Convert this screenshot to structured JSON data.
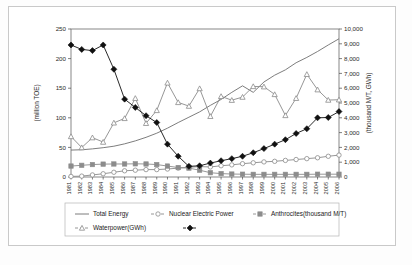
{
  "chart_data": {
    "type": "line",
    "title": "",
    "xlabel": "",
    "ylabel": "(million TOE)",
    "y2label": "(thousand M/T, GWh)",
    "ylim": [
      0,
      250
    ],
    "y2lim": [
      0,
      10000
    ],
    "yticks": [
      "0",
      "50",
      "100",
      "150",
      "200",
      "250"
    ],
    "y2ticks": [
      "0",
      "1,000",
      "2,000",
      "3,000",
      "4,000",
      "5,000",
      "6,000",
      "7,000",
      "8,000",
      "9,000",
      "10,000"
    ],
    "grid": false,
    "legend_position": "bottom",
    "categories": [
      "1981",
      "1982",
      "1983",
      "1984",
      "1985",
      "1986",
      "1987",
      "1988",
      "1989",
      "1990",
      "1991",
      "1992",
      "1993",
      "1994",
      "1995",
      "1996",
      "1997",
      "1998",
      "1999",
      "2000",
      "2001",
      "2002",
      "2003",
      "2004",
      "2005",
      "2006"
    ],
    "series": [
      {
        "name": "Total Energy",
        "axis": "left",
        "marker": "none",
        "color": "#6e6e6e",
        "values": [
          45.5,
          46.0,
          47.5,
          49.5,
          52.0,
          56.0,
          61.0,
          67.0,
          74.0,
          82.5,
          92.0,
          101.0,
          110.0,
          121.0,
          131.0,
          143.0,
          154.0,
          143.0,
          160.5,
          172.0,
          181.0,
          193.0,
          202.0,
          212.0,
          223.0,
          233.5
        ]
      },
      {
        "name": "Nuclear Electric Power",
        "axis": "left",
        "marker": "circle-open",
        "color": "#8a8a8a",
        "values": [
          1.0,
          1.5,
          3.5,
          5.5,
          8.0,
          10.5,
          11.5,
          12.5,
          12.5,
          13.5,
          15.0,
          16.5,
          17.5,
          17.0,
          19.0,
          20.5,
          22.5,
          24.0,
          25.5,
          26.5,
          28.0,
          29.5,
          31.0,
          32.5,
          35.0,
          37.0
        ]
      },
      {
        "name": "Anthrocites(thousand M/T)",
        "axis": "right",
        "marker": "square-filled",
        "color": "#8c8c8c",
        "values": [
          740,
          790,
          840,
          870,
          880,
          880,
          890,
          880,
          840,
          740,
          640,
          600,
          460,
          290,
          230,
          200,
          190,
          180,
          180,
          180,
          180,
          180,
          180,
          190,
          190,
          190
        ]
      },
      {
        "name": "Waterpower(GWh)",
        "axis": "right",
        "marker": "triangle-open",
        "color": "#8a8a8a",
        "values": [
          2740,
          1990,
          2660,
          2360,
          3660,
          3960,
          5320,
          3630,
          4500,
          6360,
          5040,
          4790,
          5980,
          4100,
          5450,
          5190,
          5400,
          6120,
          6100,
          5580,
          4160,
          5320,
          6940,
          5900,
          5200,
          5220
        ]
      },
      {
        "name": "",
        "axis": "left",
        "marker": "diamond-filled",
        "color": "#111111",
        "values": [
          223.0,
          215.5,
          213.5,
          223.0,
          182.0,
          131.5,
          117.5,
          103.5,
          92.0,
          55.5,
          35.0,
          18.0,
          19.0,
          23.5,
          27.5,
          31.0,
          35.0,
          41.0,
          48.0,
          55.5,
          63.0,
          73.5,
          81.5,
          100.0,
          100.5,
          110.5
        ]
      }
    ],
    "legend": [
      {
        "label": "Total Energy",
        "marker": "none",
        "color": "#6e6e6e"
      },
      {
        "label": "Nuclear Electric Power",
        "marker": "circle-open",
        "color": "#8a8a8a"
      },
      {
        "label": "Anthrocites(thousand M/T)",
        "marker": "square-filled",
        "color": "#8c8c8c"
      },
      {
        "label": "Waterpower(GWh)",
        "marker": "triangle-open",
        "color": "#8a8a8a"
      },
      {
        "label": "",
        "marker": "diamond-filled",
        "color": "#111111"
      }
    ]
  }
}
